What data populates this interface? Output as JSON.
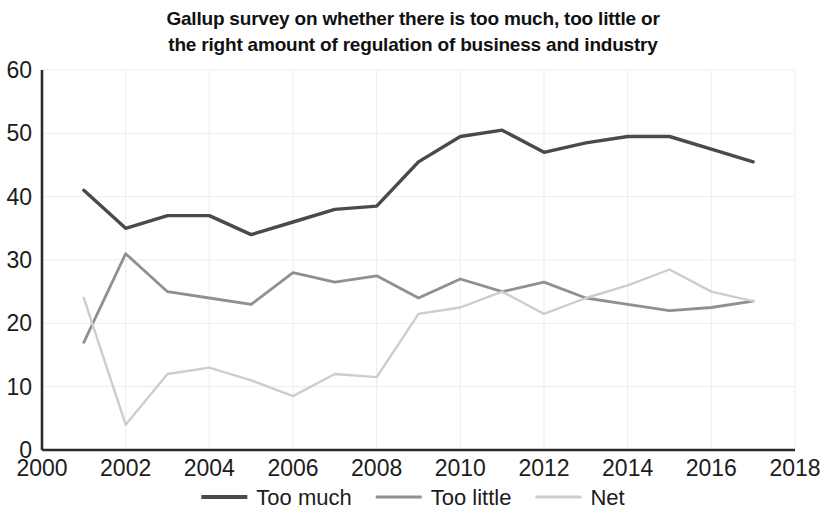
{
  "chart_data": {
    "type": "line",
    "title": "Gallup survey on whether there is too much, too little or\nthe right amount of regulation of business and industry",
    "title_line1": "Gallup survey on whether there is too much, too little or",
    "title_line2": "the right amount of regulation of business and industry",
    "xlabel": "",
    "ylabel": "",
    "xlim": [
      2000,
      2018
    ],
    "ylim": [
      0,
      60
    ],
    "xticks": [
      2000,
      2002,
      2004,
      2006,
      2008,
      2010,
      2012,
      2014,
      2016,
      2018
    ],
    "xtick_labels": [
      "2000",
      "2002",
      "2004",
      "2006",
      "2008",
      "2010",
      "2012",
      "2014",
      "2016",
      "2018"
    ],
    "yticks": [
      0,
      10,
      20,
      30,
      40,
      50,
      60
    ],
    "ytick_labels": [
      "0",
      "10",
      "20",
      "30",
      "40",
      "50",
      "60"
    ],
    "grid": true,
    "grid_color": "#ededed",
    "legend_position": "bottom",
    "x": [
      2001,
      2002,
      2003,
      2004,
      2005,
      2006,
      2007,
      2008,
      2009,
      2010,
      2011,
      2012,
      2013,
      2014,
      2015,
      2016,
      2017
    ],
    "series": [
      {
        "name": "Too much",
        "color": "#4a4a4a",
        "width": 3.4,
        "values": [
          41,
          35,
          37,
          37,
          34,
          36,
          38,
          38.5,
          45.5,
          49.5,
          50.5,
          47,
          48.5,
          49.5,
          49.5,
          47.5,
          45.5
        ]
      },
      {
        "name": "Too little",
        "color": "#909090",
        "width": 2.8,
        "values": [
          17,
          31,
          25,
          24,
          23,
          28,
          26.5,
          27.5,
          24,
          27,
          25,
          26.5,
          24,
          23,
          22,
          22.5,
          23.5
        ]
      },
      {
        "name": "Net",
        "color": "#cdcdcd",
        "width": 2.4,
        "values": [
          24,
          4,
          12,
          13,
          11,
          8.5,
          12,
          11.5,
          21.5,
          22.5,
          25,
          21.5,
          24,
          26,
          28.5,
          25,
          23.5
        ]
      }
    ]
  },
  "legend": {
    "items": [
      {
        "label": "Too much",
        "color": "#4a4a4a"
      },
      {
        "label": "Too little",
        "color": "#909090"
      },
      {
        "label": "Net",
        "color": "#cdcdcd"
      }
    ]
  },
  "axis": {
    "line_color": "#2b2b2b"
  }
}
